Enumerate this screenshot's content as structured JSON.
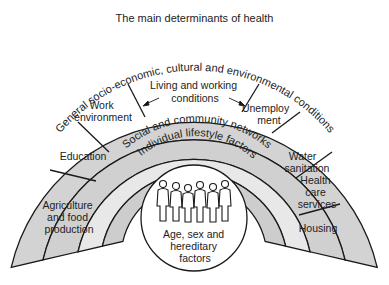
{
  "title": "The main determinants of health",
  "colors": {
    "outer_ring": "#d3d3d3",
    "middle_ring": "#d0d0d0",
    "social_ring": "#e8e8e8",
    "lifestyle_ring": "#cdcdcd",
    "core": "#ffffff",
    "stroke": "#1a1a1a"
  },
  "rings": {
    "outer": "General socio-economic, cultural and environmental conditions",
    "social": "Social and community networks",
    "lifestyle": "Individual lifestyle factors",
    "core_lines": [
      "Age, sex and",
      "hereditary",
      "factors"
    ]
  },
  "living_working": {
    "lines": [
      "Living and working",
      "conditions"
    ]
  },
  "segments": {
    "agriculture": [
      "Agriculture",
      "and food",
      "production"
    ],
    "education": [
      "Education"
    ],
    "work": [
      "Work",
      "environment"
    ],
    "unemployment": [
      "Unemploy",
      "ment"
    ],
    "water": [
      "Water",
      "sanitation"
    ],
    "health": [
      "Health",
      "care",
      "services"
    ],
    "housing": [
      "Housing"
    ]
  },
  "figures_icon": "people-silhouettes-icon"
}
